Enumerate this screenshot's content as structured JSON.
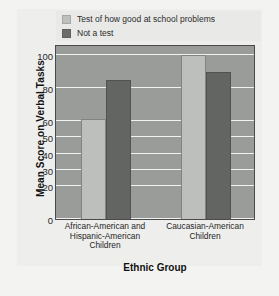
{
  "chart_data": {
    "type": "bar",
    "title": "",
    "xlabel": "Ethnic Group",
    "ylabel": "Mean Score on Verbal Tasks",
    "categories": [
      "African-American and Hispanic-American Children",
      "Caucasian-American Children"
    ],
    "series": [
      {
        "name": "Test of how good at school problems",
        "color": "#bdbfbc",
        "values": [
          61,
          100
        ]
      },
      {
        "name": "Not a test",
        "color": "#636563",
        "values": [
          85,
          90
        ]
      }
    ],
    "ylim": [
      0,
      107
    ],
    "yticks": [
      0,
      20,
      30,
      40,
      50,
      60,
      80,
      100
    ],
    "ytick_labels": [
      "0",
      "20",
      "30",
      "40",
      "50",
      "60",
      "80",
      "100"
    ],
    "grid": true,
    "legend_position": "top",
    "plot_background": "#9a9c99",
    "gridline_color": "#f0f0ee",
    "figure_background": "#f3f3f1"
  },
  "legend": {
    "items": [
      {
        "label": "Test of how good at school problems",
        "swatch": "light-swatch-icon"
      },
      {
        "label": "Not a test",
        "swatch": "dark-swatch-icon"
      }
    ]
  },
  "axes": {
    "y_title": "Mean Score on Verbal Tasks",
    "x_title": "Ethnic Group",
    "y_ticks": [
      "100",
      "80",
      "60",
      "50",
      "40",
      "30",
      "20",
      "0"
    ],
    "x_categories": [
      {
        "line1": "African-American and",
        "line2": "Hispanic-American",
        "line3": "Children"
      },
      {
        "line1": "Caucasian-American",
        "line2": "Children",
        "line3": ""
      }
    ]
  }
}
